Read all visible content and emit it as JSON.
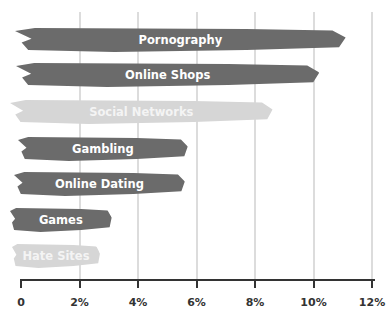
{
  "chart_data": {
    "type": "bar",
    "orientation": "horizontal",
    "title": "",
    "xlabel": "",
    "ylabel": "",
    "categories": [
      "Pornography",
      "Online Shops",
      "Social Networks",
      "Gambling",
      "Online Dating",
      "Games",
      "Hate Sites"
    ],
    "values": [
      11.1,
      10.2,
      8.6,
      5.7,
      5.6,
      3.1,
      2.7
    ],
    "colors": [
      "#6b6b6b",
      "#6b6b6b",
      "#d6d6d6",
      "#6b6b6b",
      "#6b6b6b",
      "#6b6b6b",
      "#d6d6d6"
    ],
    "xlim": [
      0,
      12
    ],
    "xticks": [
      "0",
      "2%",
      "4%",
      "6%",
      "8%",
      "10%",
      "12%"
    ],
    "grid": true,
    "legend": "none",
    "labels_inside_bars": true
  }
}
